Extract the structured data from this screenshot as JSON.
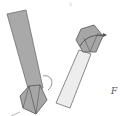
{
  "diagram": {
    "left_prism": {
      "fill": "#a9a9a9",
      "stroke": "#666666",
      "pentagon_position": "bottom"
    },
    "right_prism": {
      "fill": "#ededed",
      "stroke": "#666666",
      "pentagon_fill": "#a9a9a9",
      "pentagon_position": "top"
    },
    "labels": [
      {
        "text": "F",
        "x": 111,
        "y": 86
      }
    ],
    "top_mark": {
      "text": "s"
    }
  }
}
